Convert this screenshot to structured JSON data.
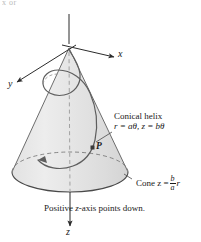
{
  "figure": {
    "type": "math-diagram",
    "top_crop_fragment": "x or",
    "axes": {
      "x_label": "x",
      "y_label": "y",
      "z_label": "z"
    },
    "point_label": "P",
    "annotations": {
      "helix_title": "Conical helix",
      "helix_equation": "r = aθ, z = bθ",
      "cone_prefix": "Cone z =",
      "cone_frac_num": "b",
      "cone_frac_den": "a",
      "cone_suffix": "r"
    },
    "caption": {
      "before": "Positive ",
      "italic": "z",
      "after": "-axis points down."
    },
    "colors": {
      "cone_fill": "#e6e6e6",
      "cone_fill_light": "#f0f0f0",
      "base_fill": "#dcdcdc",
      "stroke": "#4a4a4a",
      "axis": "#2b2b2b",
      "helix": "#5a5a5a",
      "dashed": "#8c8c8c",
      "text": "#1a1a1a"
    },
    "geometry": {
      "apex": [
        69,
        48
      ],
      "base_center": [
        70,
        172
      ],
      "base_rx": 58,
      "base_ry": 20,
      "point_P": [
        93,
        148
      ]
    }
  }
}
